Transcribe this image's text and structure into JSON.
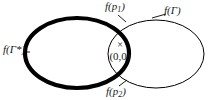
{
  "figure": {
    "type": "venn-two-ellipses",
    "background_color": "#ffffff",
    "stroke_color": "#000000",
    "text_color": "#1a1a1a",
    "width": 211,
    "height": 100
  },
  "shapes": {
    "left_ellipse": {
      "name": "f(Gamma-star) curve",
      "center_x": 77,
      "center_y": 53,
      "radius_x": 52,
      "radius_y": 35,
      "stroke_width": 4.2,
      "emphasis": "thick"
    },
    "right_ellipse": {
      "name": "f(Gamma) curve",
      "center_x": 156,
      "center_y": 54,
      "radius_x": 48,
      "radius_y": 34,
      "stroke_width": 1,
      "emphasis": "thin"
    }
  },
  "labels": {
    "left_curve": {
      "text_prefix": "f(Γ",
      "text_mark": "*",
      "text_suffix": ")",
      "full": "f(Γ*)"
    },
    "right_curve": {
      "full": "f(Γ)"
    },
    "top_point": {
      "base": "f(p",
      "subscript": "1",
      "close": ")",
      "full": "f(p1)"
    },
    "bottom_point": {
      "base": "f(p",
      "subscript": "2",
      "close": ")",
      "full": "f(p2)"
    },
    "origin_marker": "×",
    "origin_coords": "(0,0)"
  }
}
